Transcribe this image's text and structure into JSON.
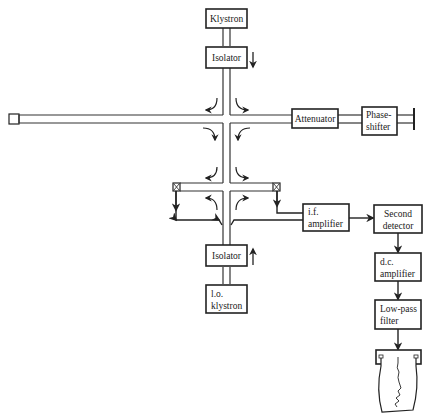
{
  "diagram": {
    "type": "microwave superheterodyne receiver block diagram",
    "blocks": {
      "klystron": {
        "label": "Klystron"
      },
      "isolator_top": {
        "label": "Isolator"
      },
      "attenuator": {
        "label": "Attenuator"
      },
      "phase_shifter": {
        "line1": "Phase-",
        "line2": "shifter"
      },
      "if_amplifier": {
        "line1": "i.f.",
        "line2": "amplifier"
      },
      "second_detector": {
        "line1": "Second",
        "line2": "detector"
      },
      "dc_amplifier": {
        "line1": "d.c.",
        "line2": "amplifier"
      },
      "lowpass_filter": {
        "line1": "Low-pass",
        "line2": "filter"
      },
      "isolator_bottom": {
        "label": "Isolator"
      },
      "lo_klystron": {
        "line1": "l.o.",
        "line2": "klystron"
      }
    },
    "elements": [
      "waveguide-tee-upper",
      "waveguide-tee-lower",
      "sample-cavity",
      "crystal-detector-left",
      "crystal-detector-right",
      "chart-recorder",
      "short-circuit-termination"
    ],
    "connections": [
      [
        "Klystron",
        "Isolator"
      ],
      [
        "Isolator",
        "upper hybrid tee"
      ],
      [
        "upper hybrid tee",
        "Attenuator"
      ],
      [
        "Attenuator",
        "Phase-shifter"
      ],
      [
        "upper hybrid tee",
        "lower hybrid tee"
      ],
      [
        "lower hybrid tee",
        "i.f. amplifier"
      ],
      [
        "i.f. amplifier",
        "Second detector"
      ],
      [
        "Second detector",
        "d.c. amplifier"
      ],
      [
        "d.c. amplifier",
        "Low-pass filter"
      ],
      [
        "Low-pass filter",
        "Chart recorder"
      ],
      [
        "l.o. klystron",
        "Isolator (lower)"
      ],
      [
        "Isolator (lower)",
        "lower hybrid tee"
      ]
    ]
  }
}
